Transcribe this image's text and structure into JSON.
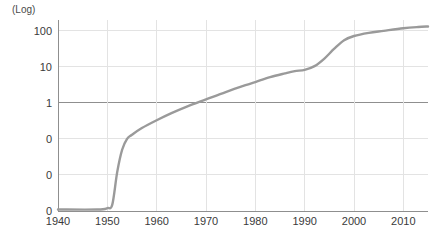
{
  "chart_data": {
    "type": "line",
    "title": "",
    "subtitle": "",
    "xlabel": "",
    "ylabel": "(Log)",
    "yscale": "log",
    "grid": true,
    "legend": null,
    "xlim": [
      1940,
      2015
    ],
    "ylim": [
      0.001,
      200
    ],
    "x_ticks": [
      1940,
      1950,
      1960,
      1970,
      1980,
      1990,
      2000,
      2010
    ],
    "x_tick_labels": [
      "1940",
      "1950",
      "1960",
      "1970",
      "1980",
      "1990",
      "2000",
      "2010"
    ],
    "y_ticks": [
      0.001,
      0.01,
      0.1,
      1,
      10,
      100
    ],
    "y_tick_labels": [
      "0",
      "0",
      "0",
      "1",
      "10",
      "100"
    ],
    "emphasized_gridline_y": 1,
    "line_color": "#9a9a9a",
    "grid_color": "#e3e3e3",
    "axis_color": "#8f8f8f",
    "series": [
      {
        "name": "value",
        "x": [
          1940,
          1948,
          1950,
          1951,
          1952,
          1953,
          1954,
          1955,
          1957,
          1960,
          1963,
          1966,
          1970,
          1974,
          1978,
          1980,
          1983,
          1986,
          1988,
          1990,
          1992,
          1994,
          1996,
          1998,
          2000,
          2003,
          2006,
          2010,
          2013,
          2015
        ],
        "y": [
          0.0011,
          0.0011,
          0.0012,
          0.0015,
          0.012,
          0.05,
          0.1,
          0.13,
          0.2,
          0.33,
          0.52,
          0.78,
          1.25,
          2.0,
          3.1,
          3.8,
          5.2,
          6.6,
          7.6,
          8.3,
          10.5,
          17,
          32,
          55,
          72,
          88,
          100,
          118,
          128,
          132
        ]
      }
    ]
  },
  "axis": {
    "unit_label": "(Log)"
  }
}
